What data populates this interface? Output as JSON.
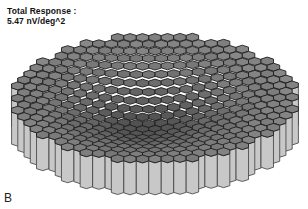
{
  "annotation": {
    "title": "Total Response :",
    "value": "5.47 nV/deg^2"
  },
  "panel_label": "B",
  "figure": {
    "type": "3d-hexagonal-surface",
    "colors": {
      "top_light": "#8a8a8a",
      "top_mid": "#6a6a6a",
      "top_dark": "#3a3a3a",
      "edge": "#1e1e1e",
      "wall": "#c8c8c8",
      "wall_edge": "#3c3c3c"
    }
  }
}
